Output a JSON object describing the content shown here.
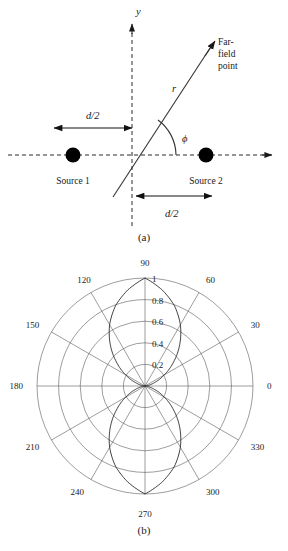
{
  "figure": {
    "panel_a": {
      "caption": "(a)",
      "axis_y_label": "y",
      "ray_label": "r",
      "angle_label": "ϕ",
      "farfield_lines": [
        "Far-",
        "field",
        "point"
      ],
      "source_left_label": "Source 1",
      "source_right_label": "Source 2",
      "dim_left_label": "d/2",
      "dim_right_label": "d/2",
      "dim_label_italic_part": "d",
      "dim_label_rest": "/2"
    },
    "panel_b": {
      "caption": "(b)",
      "angle_labels": [
        "0",
        "30",
        "60",
        "90",
        "120",
        "150",
        "180",
        "210",
        "240",
        "270",
        "300",
        "330"
      ],
      "radial_labels": [
        "0.2",
        "0.4",
        "0.6",
        "0.8",
        "1"
      ]
    }
  },
  "chart_data": {
    "type": "line",
    "subtype": "polar",
    "title": "",
    "xlabel": "",
    "ylabel": "",
    "angle_unit": "degrees",
    "theta_ticks": [
      0,
      30,
      60,
      90,
      120,
      150,
      180,
      210,
      240,
      270,
      300,
      330
    ],
    "theta_tick_labels": [
      "0",
      "30",
      "60",
      "90",
      "120",
      "150",
      "180",
      "210",
      "240",
      "270",
      "300",
      "330"
    ],
    "r_ticks": [
      0.2,
      0.4,
      0.6,
      0.8,
      1.0
    ],
    "r_tick_labels": [
      "0.2",
      "0.4",
      "0.6",
      "0.8",
      "1"
    ],
    "rlim": [
      0,
      1
    ],
    "grid": true,
    "legend": false,
    "series": [
      {
        "name": "two-source array factor |sin(π/2 · cosϕ)| pattern",
        "description": "figure-eight lobes with maxima at 90 and 270 degrees, nulls at 0 and 180 degrees",
        "theta": [
          0,
          10,
          20,
          30,
          40,
          50,
          60,
          70,
          80,
          90,
          100,
          110,
          120,
          130,
          140,
          150,
          160,
          170,
          180,
          190,
          200,
          210,
          220,
          230,
          240,
          250,
          260,
          270,
          280,
          290,
          300,
          310,
          320,
          330,
          340,
          350,
          360
        ],
        "r": [
          0.0,
          0.024,
          0.095,
          0.206,
          0.345,
          0.5,
          0.655,
          0.794,
          0.905,
          1.0,
          0.905,
          0.794,
          0.655,
          0.5,
          0.345,
          0.206,
          0.095,
          0.024,
          0.0,
          0.024,
          0.095,
          0.206,
          0.345,
          0.5,
          0.655,
          0.794,
          0.905,
          1.0,
          0.905,
          0.794,
          0.655,
          0.5,
          0.345,
          0.206,
          0.095,
          0.024,
          0.0
        ]
      }
    ]
  }
}
